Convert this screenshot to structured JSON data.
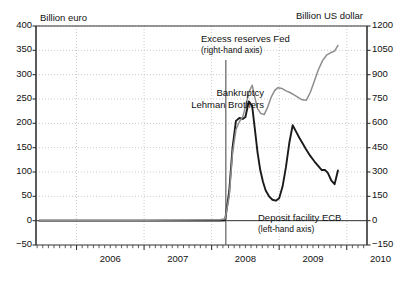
{
  "chart_data": {
    "type": "line",
    "title": "",
    "subtitle": "",
    "xlabel": "",
    "ylabel": "Billion euro",
    "y2label": "Billion US dollar",
    "grid": true,
    "legend_position": "inline-annotations",
    "x_tick_labels": [
      "2006",
      "2007",
      "2008",
      "2009",
      "2010"
    ],
    "x_tick_values": [
      2006,
      2007,
      2008,
      2009,
      2010
    ],
    "xlim": [
      2005.4,
      2010.3
    ],
    "ylim": [
      -50,
      400
    ],
    "y2lim": [
      -150,
      1200
    ],
    "y_tick_labels": [
      "400",
      "350",
      "300",
      "250",
      "200",
      "150",
      "100",
      "50",
      "0",
      "-50"
    ],
    "y_tick_values": [
      400,
      350,
      300,
      250,
      200,
      150,
      100,
      50,
      0,
      -50
    ],
    "y2_tick_labels": [
      "1200",
      "1050",
      "900",
      "750",
      "600",
      "450",
      "300",
      "150",
      "0",
      "-150"
    ],
    "y2_tick_values": [
      1200,
      1050,
      900,
      750,
      600,
      450,
      300,
      150,
      0,
      -150
    ],
    "minor_x_ticks_per_year": 12,
    "annotations": [
      {
        "id": "fed",
        "line1": "Excess reserves Fed",
        "line2": "(right-hand axis)"
      },
      {
        "id": "lehman",
        "line1": "Bankruptcy",
        "line2": "Lehman Brothers"
      },
      {
        "id": "ecb",
        "line1": "Deposit facility ECB",
        "line2": "(left-hand axis)"
      }
    ],
    "event_marker": {
      "label": "Bankruptcy Lehman Brothers",
      "x": 2008.21,
      "y_top": 330,
      "y_bottom": -50
    },
    "series": [
      {
        "name": "Deposit facility ECB",
        "axis": "left",
        "color": "#1a1a1a",
        "x": [
          2005.45,
          2006.0,
          2006.5,
          2007.0,
          2007.5,
          2008.0,
          2008.12,
          2008.2,
          2008.26,
          2008.31,
          2008.36,
          2008.41,
          2008.46,
          2008.5,
          2008.55,
          2008.6,
          2008.64,
          2008.68,
          2008.72,
          2008.76,
          2008.8,
          2008.85,
          2008.9,
          2008.95,
          2009.0,
          2009.05,
          2009.1,
          2009.15,
          2009.2,
          2009.25,
          2009.3,
          2009.35,
          2009.4,
          2009.46,
          2009.52,
          2009.58,
          2009.63,
          2009.68,
          2009.72,
          2009.77,
          2009.82,
          2009.87
        ],
        "values": [
          0,
          0,
          0,
          0,
          0,
          0,
          0,
          1,
          60,
          150,
          205,
          211,
          209,
          213,
          245,
          236,
          188,
          140,
          104,
          80,
          62,
          50,
          43,
          41,
          46,
          70,
          110,
          160,
          196,
          183,
          170,
          158,
          146,
          133,
          122,
          112,
          104,
          104,
          98,
          83,
          75,
          103
        ]
      },
      {
        "name": "Excess reserves Fed",
        "axis": "right",
        "color": "#8e8e8e",
        "x": [
          2005.45,
          2006.0,
          2006.5,
          2007.0,
          2007.5,
          2008.0,
          2008.12,
          2008.2,
          2008.26,
          2008.31,
          2008.36,
          2008.41,
          2008.46,
          2008.5,
          2008.55,
          2008.6,
          2008.64,
          2008.68,
          2008.73,
          2008.78,
          2008.83,
          2008.88,
          2008.93,
          2008.98,
          2009.04,
          2009.1,
          2009.16,
          2009.22,
          2009.28,
          2009.34,
          2009.4,
          2009.46,
          2009.52,
          2009.58,
          2009.64,
          2009.7,
          2009.76,
          2009.82,
          2009.87
        ],
        "values": [
          3,
          3,
          3,
          3,
          4,
          5,
          6,
          12,
          150,
          420,
          560,
          610,
          640,
          700,
          790,
          835,
          760,
          690,
          660,
          655,
          700,
          760,
          800,
          820,
          815,
          800,
          790,
          775,
          760,
          745,
          742,
          790,
          860,
          930,
          985,
          1020,
          1035,
          1045,
          1080
        ]
      }
    ]
  }
}
